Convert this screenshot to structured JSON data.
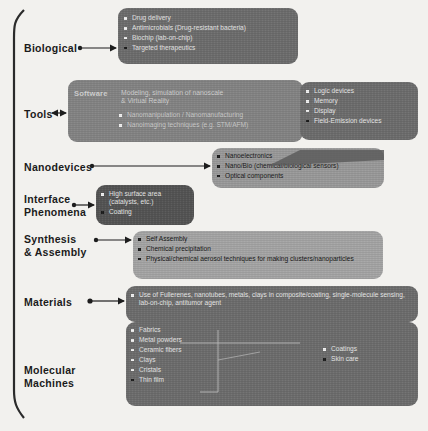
{
  "diagram": {
    "colors": {
      "background": "#f2f1ee",
      "brace": "#2b2b2b",
      "arrow": "#1d1d1d",
      "box_dark": "#6e6e6e",
      "box_mid": "#848484",
      "box_light": "#9a9a9a",
      "box_xdark": "#555555",
      "text_light": "#e6e6e6",
      "label_text": "#1b1b1b"
    },
    "categories": [
      {
        "id": "biological",
        "label": "Biological"
      },
      {
        "id": "tools",
        "label": "Tools"
      },
      {
        "id": "nanodevices",
        "label": "Nanodevices"
      },
      {
        "id": "interface-phenomena",
        "label": "Interface\nPhenomena"
      },
      {
        "id": "synthesis-assembly",
        "label": "Synthesis\n& Assembly"
      },
      {
        "id": "materials",
        "label": "Materials"
      },
      {
        "id": "molecular-machines",
        "label": "Molecular\nMachines"
      }
    ],
    "boxes": {
      "biological": {
        "items": [
          "Drug delivery",
          "Antimicrobials (Drug-resistant bacteria)",
          "Biochip (lab-on-chip)",
          "Targeted therapeutics"
        ]
      },
      "tools_software": {
        "label": "Software",
        "text_line1": "Modeling, simulation of nanoscale",
        "text_line2": "& Virtual Reality",
        "items": [
          "Nanomanipulation / Nanomanufacturing",
          "Nanoimaging techniques (e.g. STM/AFM)"
        ]
      },
      "tools_devices": {
        "items": [
          "Logic devices",
          "Memory",
          "Display",
          "Field-Emission devices"
        ]
      },
      "nanodevices": {
        "items": [
          "Nanoelectronics",
          "Nano/Bio (chemical/biological sensors)",
          "Optical components"
        ]
      },
      "interface_phenomena": {
        "items": [
          "High surface area (catalysts, etc.)",
          "Coating"
        ]
      },
      "synthesis_assembly": {
        "items": [
          "Self Assembly",
          "Chemical precipitation",
          "Physical/chemical aerosol techniques for making clusters/nanoparticles"
        ]
      },
      "materials": {
        "items": [
          "Use of Fullerenes, nanotubes, metals, clays in composite/coating, single-molecule sensing, lab-on-chip, antitumor agent"
        ]
      },
      "molecular_machines": {
        "items_left": [
          "Fabrics",
          "Metal powders",
          "Ceramic fibers",
          "Clays",
          "Cristals",
          "Thin film"
        ],
        "items_right": [
          "Coatings",
          "Skin care"
        ]
      }
    }
  }
}
